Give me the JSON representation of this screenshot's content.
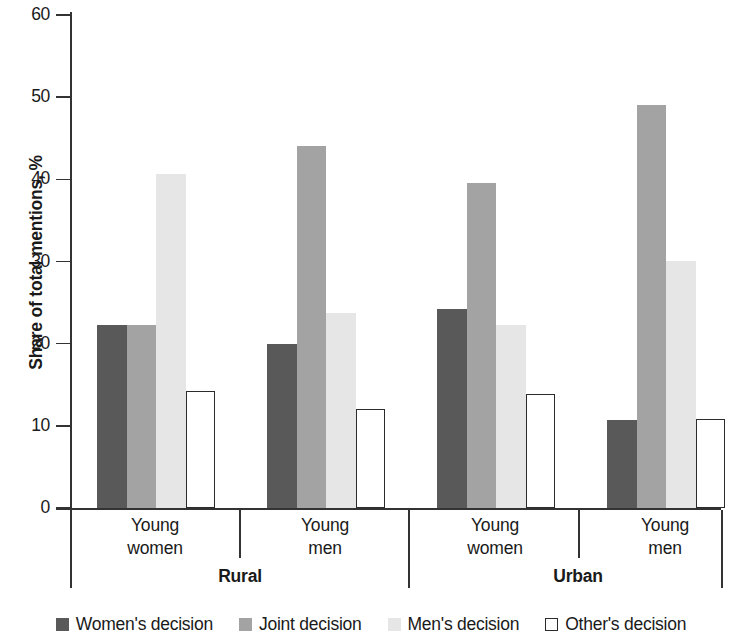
{
  "chart_data": {
    "type": "bar",
    "title": "",
    "subtitle": "",
    "xlabel": "",
    "ylabel": "Share of total mentions, %",
    "ylim": [
      0,
      60
    ],
    "yticks": [
      0,
      10,
      20,
      30,
      40,
      50,
      60
    ],
    "grid": false,
    "legend_position": "bottom",
    "categories": [
      "Young women",
      "Young men",
      "Young women",
      "Young men"
    ],
    "group_labels": [
      "Rural",
      "Urban"
    ],
    "groups": [
      {
        "group": "Rural",
        "subgroups": [
          {
            "label_line1": "Young",
            "label_line2": "women",
            "values": [
              22.3,
              22.3,
              40.7,
              14.3
            ]
          },
          {
            "label_line1": "Young",
            "label_line2": "men",
            "values": [
              20.0,
              44.1,
              23.7,
              12.0
            ]
          }
        ]
      },
      {
        "group": "Urban",
        "subgroups": [
          {
            "label_line1": "Young",
            "label_line2": "women",
            "values": [
              24.2,
              39.6,
              22.3,
              13.9
            ]
          },
          {
            "label_line1": "Young",
            "label_line2": "men",
            "values": [
              10.7,
              49.1,
              30.1,
              10.8
            ]
          }
        ]
      }
    ],
    "series": [
      {
        "name": "Women's decision",
        "color": "#595959",
        "values": [
          22.3,
          20.0,
          24.2,
          10.7
        ]
      },
      {
        "name": "Joint decision",
        "color": "#a3a3a3",
        "values": [
          22.3,
          44.1,
          39.6,
          49.1
        ]
      },
      {
        "name": "Men's decision",
        "color": "#e6e6e6",
        "values": [
          40.7,
          23.7,
          22.3,
          30.1
        ]
      },
      {
        "name": "Other's decision",
        "color": "#ffffff",
        "values": [
          14.3,
          12.0,
          13.9,
          10.8
        ]
      }
    ],
    "legend": [
      {
        "label": "Women's decision",
        "swatch": "s0"
      },
      {
        "label": "Joint decision",
        "swatch": "s1"
      },
      {
        "label": "Men's decision",
        "swatch": "s2"
      },
      {
        "label": "Other's decision",
        "swatch": "s3"
      }
    ]
  }
}
